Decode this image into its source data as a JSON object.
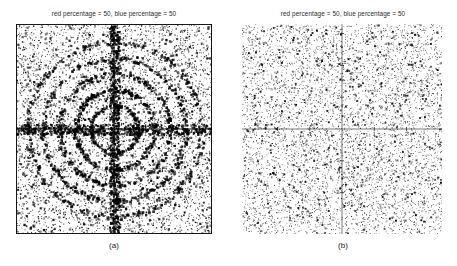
{
  "figure": {
    "background_color": "#ffffff",
    "ink_color": "#000000",
    "panels": [
      {
        "id": "a",
        "caption": "(a)",
        "title": "red percentage = 50, blue percentage = 50",
        "has_frame": true
      },
      {
        "id": "b",
        "caption": "(b)",
        "title": "red percentage = 50, blue percentage = 50",
        "has_frame": false
      }
    ]
  },
  "chart_data": [
    {
      "type": "scatter",
      "panel": "a",
      "title": "red percentage = 50, blue percentage = 50",
      "xlabel": "",
      "ylabel": "",
      "xlim": [
        -3.1,
        3.1
      ],
      "ylim": [
        -3.3,
        3.3
      ],
      "xticks": [
        -2,
        -1,
        1,
        2
      ],
      "xtick_labels": [
        "-2",
        "-1",
        "1",
        "2"
      ],
      "yticks": [
        3,
        2,
        1,
        -1,
        -2
      ],
      "ytick_labels": [
        "3",
        "2",
        "1",
        "-1",
        "-2"
      ],
      "grid": false,
      "legend": "none",
      "axes_style": "crossed-at-origin",
      "frame": true,
      "point_color": "#000000",
      "point_size_px": 1.35,
      "background_noise_points": 5200,
      "noise_distribution": "uniform",
      "structure": "concentric rings plus dense axis lines",
      "annotations": [
        "dark vertical line along x = 0",
        "dark horizontal line along y = 0",
        "clustered points concentrated on several concentric circles centred on origin"
      ],
      "rings": [
        {
          "radius": 0.75,
          "points": 170,
          "jitter": 0.055,
          "weight": 0.85
        },
        {
          "radius": 1.25,
          "points": 230,
          "jitter": 0.06,
          "weight": 1.0
        },
        {
          "radius": 1.75,
          "points": 260,
          "jitter": 0.07,
          "weight": 0.9
        },
        {
          "radius": 2.25,
          "points": 300,
          "jitter": 0.075,
          "weight": 0.8
        },
        {
          "radius": 2.75,
          "points": 330,
          "jitter": 0.085,
          "weight": 0.7
        }
      ],
      "axis_bands": [
        {
          "orientation": "vertical",
          "points": 620,
          "spread": 0.05
        },
        {
          "orientation": "horizontal",
          "points": 560,
          "spread": 0.05
        }
      ]
    },
    {
      "type": "scatter",
      "panel": "b",
      "title": "red percentage = 50, blue percentage = 50",
      "xlabel": "",
      "ylabel": "",
      "xlim": [
        -3.1,
        3.1
      ],
      "ylim": [
        -3.3,
        3.3
      ],
      "xticks": [
        -2,
        -1,
        1,
        2
      ],
      "xtick_labels": [
        "-2",
        "-1",
        "1",
        "2"
      ],
      "yticks": [
        3,
        2,
        1,
        -1,
        -2
      ],
      "ytick_labels": [
        "3",
        "2",
        "1",
        "-1",
        "-2"
      ],
      "grid": false,
      "legend": "none",
      "axes_style": "crossed-at-origin",
      "frame": false,
      "point_color": "#000000",
      "point_size_px": 1.0,
      "background_noise_points": 6200,
      "noise_distribution": "uniform",
      "structure": "uniform random scatter, no rings",
      "annotations": [
        "thin vertical axis line at x = 0",
        "thin horizontal axis line at y = 0",
        "no ring structure present"
      ],
      "rings": [],
      "axis_bands": []
    }
  ]
}
